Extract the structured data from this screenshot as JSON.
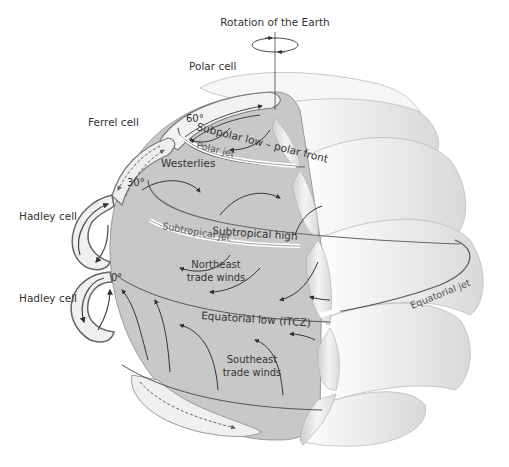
{
  "title": "Rotation of the Earth",
  "cells": {
    "polar": "Polar cell",
    "ferrel": "Ferrel cell",
    "hadley_north": "Hadley cell",
    "hadley_south": "Hadley cell"
  },
  "latitudes": {
    "lat60": "60°",
    "lat30": "30°",
    "lat0": "0°"
  },
  "pressure_zones": {
    "subpolar_low": "Subpolar low – polar front",
    "subtropical_high": "Subtropical high",
    "equatorial_low": "Equatorial low (ITCZ)"
  },
  "jets": {
    "polar": "Polar jet",
    "subtropical": "Subtropical jet",
    "equatorial": "Equatorial jet"
  },
  "winds": {
    "westerlies": "Westerlies",
    "northeast_trades_1": "Northeast",
    "northeast_trades_2": "trade winds",
    "southeast_trades_1": "Southeast",
    "southeast_trades_2": "trade winds"
  },
  "colors": {
    "globe_fill": "#c8c8c8",
    "cell_fill": "#f0f0f0",
    "outline": "#555555",
    "arrow": "#333333"
  }
}
